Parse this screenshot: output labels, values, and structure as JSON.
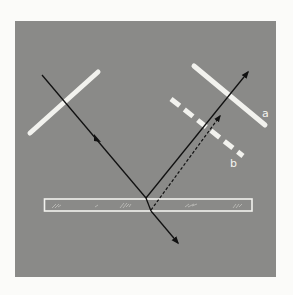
{
  "diagram": {
    "title": "",
    "type": "optics-reflection-refraction",
    "colors": {
      "page_background": "#fbfbf9",
      "panel_background": "#8a8a88",
      "polarizer": "#f2f2ee",
      "ray": "#111111",
      "slab_outline": "#f2f2ee"
    },
    "labels": {
      "polarizer_a": "a",
      "polarizer_b": "b"
    },
    "elements": {
      "incident_polarizer": "solid bar, upper left, crossed by incident ray",
      "incident_ray": "arrow from upper left down to slab surface",
      "glass_slab": "horizontal transparent plate",
      "reflected_ray": "solid arrow, up-right from top surface",
      "reflected_ray_bottom": "dashed arrow, up-right from bottom surface",
      "transmitted_ray": "arrow exiting slab, down-right",
      "analyzer_a": "solid bar, upper right",
      "analyzer_b": "dashed bar, below analyzer a"
    }
  }
}
